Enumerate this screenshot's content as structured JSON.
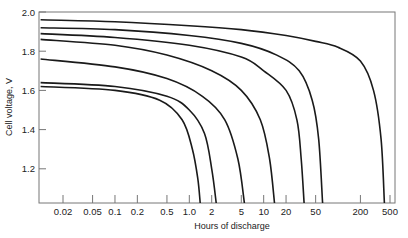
{
  "chart_data": {
    "type": "line",
    "title": "",
    "xlabel": "Hours of discharge",
    "ylabel": "Cell voltage, V",
    "x_scale": "log",
    "xlim": [
      0.01,
      500
    ],
    "ylim": [
      1.0,
      2.0
    ],
    "grid": false,
    "legend": "none",
    "y_ticks": [
      {
        "value": 2.0,
        "label": "2.0"
      },
      {
        "value": 1.8,
        "label": "1.8"
      },
      {
        "value": 1.6,
        "label": "1.6"
      },
      {
        "value": 1.4,
        "label": "1.4"
      },
      {
        "value": 1.2,
        "label": "1.2"
      }
    ],
    "x_ticks": [
      {
        "value": 0.02,
        "label": "0.02"
      },
      {
        "value": 0.05,
        "label": "0.05"
      },
      {
        "value": 0.1,
        "label": "0.1"
      },
      {
        "value": 0.2,
        "label": "0.2"
      },
      {
        "value": 0.5,
        "label": "0.5"
      },
      {
        "value": 1.0,
        "label": "1.0"
      },
      {
        "value": 2,
        "label": "2"
      },
      {
        "value": 5,
        "label": "5"
      },
      {
        "value": 10,
        "label": "10"
      },
      {
        "value": 20,
        "label": "20"
      },
      {
        "value": 50,
        "label": "50"
      },
      {
        "value": 200,
        "label": "200"
      },
      {
        "value": 500,
        "label": "500"
      }
    ],
    "series": [
      {
        "name": "curve-1",
        "points": [
          [
            0.01,
            1.96
          ],
          [
            0.1,
            1.95
          ],
          [
            1,
            1.93
          ],
          [
            5,
            1.91
          ],
          [
            20,
            1.88
          ],
          [
            50,
            1.85
          ],
          [
            100,
            1.82
          ],
          [
            200,
            1.75
          ],
          [
            300,
            1.6
          ],
          [
            380,
            1.35
          ],
          [
            420,
            1.0
          ]
        ]
      },
      {
        "name": "curve-2",
        "points": [
          [
            0.01,
            1.92
          ],
          [
            0.1,
            1.91
          ],
          [
            1,
            1.88
          ],
          [
            5,
            1.84
          ],
          [
            15,
            1.78
          ],
          [
            30,
            1.7
          ],
          [
            45,
            1.55
          ],
          [
            55,
            1.35
          ],
          [
            62,
            1.0
          ]
        ]
      },
      {
        "name": "curve-3",
        "points": [
          [
            0.01,
            1.89
          ],
          [
            0.1,
            1.87
          ],
          [
            1,
            1.83
          ],
          [
            5,
            1.77
          ],
          [
            10,
            1.7
          ],
          [
            20,
            1.6
          ],
          [
            28,
            1.45
          ],
          [
            32,
            1.25
          ],
          [
            35,
            1.0
          ]
        ]
      },
      {
        "name": "curve-4",
        "points": [
          [
            0.01,
            1.86
          ],
          [
            0.1,
            1.83
          ],
          [
            0.5,
            1.78
          ],
          [
            2,
            1.7
          ],
          [
            5,
            1.6
          ],
          [
            9,
            1.45
          ],
          [
            12,
            1.25
          ],
          [
            14,
            1.0
          ]
        ]
      },
      {
        "name": "curve-5",
        "points": [
          [
            0.01,
            1.76
          ],
          [
            0.1,
            1.72
          ],
          [
            0.5,
            1.66
          ],
          [
            1.5,
            1.57
          ],
          [
            3,
            1.45
          ],
          [
            4.5,
            1.25
          ],
          [
            5.5,
            1.0
          ]
        ]
      },
      {
        "name": "curve-6",
        "points": [
          [
            0.01,
            1.64
          ],
          [
            0.1,
            1.62
          ],
          [
            0.5,
            1.57
          ],
          [
            1,
            1.5
          ],
          [
            1.6,
            1.38
          ],
          [
            2.0,
            1.2
          ],
          [
            2.3,
            1.0
          ]
        ]
      },
      {
        "name": "curve-7",
        "points": [
          [
            0.01,
            1.62
          ],
          [
            0.1,
            1.6
          ],
          [
            0.4,
            1.55
          ],
          [
            0.8,
            1.45
          ],
          [
            1.1,
            1.3
          ],
          [
            1.3,
            1.15
          ],
          [
            1.4,
            1.0
          ]
        ]
      }
    ]
  }
}
